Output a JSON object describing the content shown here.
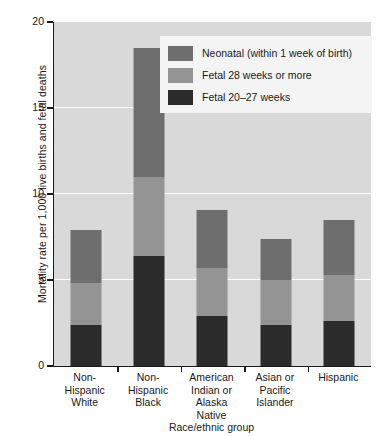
{
  "chart_data": {
    "type": "bar",
    "subtype": "stacked-vertical",
    "title": "",
    "xlabel": "Race/ethnic group",
    "ylabel": "Mortality rate per 1,000 live births and fetal deaths",
    "ylim": [
      0,
      20
    ],
    "yticks": [
      0,
      5,
      10,
      15,
      20
    ],
    "ytick_labels": [
      "0",
      "5",
      "10",
      "15",
      "20"
    ],
    "grid": "horizontal-white",
    "legend_position": "top-right-inside",
    "categories": [
      "Non-\nHispanic\nWhite",
      "Non-\nHispanic\nBlack",
      "American\nIndian or\nAlaska\nNative",
      "Asian or\nPacific\nIslander",
      "Hispanic"
    ],
    "category_lines": [
      [
        "Non-",
        "Hispanic",
        "White"
      ],
      [
        "Non-",
        "Hispanic",
        "Black"
      ],
      [
        "American",
        "Indian or",
        "Alaska",
        "Native"
      ],
      [
        "Asian or",
        "Pacific",
        "Islander"
      ],
      [
        "Hispanic"
      ]
    ],
    "series": [
      {
        "name": "Fetal 20–27 weeks",
        "color": "#2b2b2b",
        "stack_order": 0,
        "values": [
          2.4,
          6.4,
          2.9,
          2.4,
          2.6
        ]
      },
      {
        "name": "Fetal 28 weeks or more",
        "color": "#949494",
        "stack_order": 1,
        "values": [
          2.4,
          4.6,
          2.8,
          2.6,
          2.7
        ]
      },
      {
        "name": "Neonatal (within 1 week of birth)",
        "color": "#6e6e6e",
        "stack_order": 2,
        "values": [
          3.1,
          7.5,
          3.4,
          2.4,
          3.2
        ]
      }
    ],
    "totals": [
      7.9,
      18.5,
      9.1,
      7.4,
      8.5
    ],
    "legend_entries": [
      {
        "label": "Neonatal (within 1 week of birth)",
        "color": "#6e6e6e"
      },
      {
        "label": "Fetal 28 weeks or more",
        "color": "#949494"
      },
      {
        "label": "Fetal 20–27 weeks",
        "color": "#2b2b2b"
      }
    ]
  },
  "colors": {
    "plot_background": "#d9d9d9",
    "figure_background": "#ffffff",
    "gridline": "#ffffff",
    "axis": "#1a1a1a",
    "text": "#1a1a1a",
    "legend_background": "#f4f4f4",
    "neonatal": "#6e6e6e",
    "fetal_28_plus": "#949494",
    "fetal_20_27": "#2b2b2b"
  }
}
